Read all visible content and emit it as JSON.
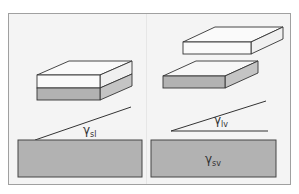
{
  "diagram": {
    "colors": {
      "frame_fill": "#f4f4f4",
      "frame_border": "#9a9a9a",
      "substrate_fill": "#b2b2b2",
      "layer_gray": "#b2b2b2",
      "layer_gray_side": "#c4c4c4",
      "layer_white": "#fafafa",
      "line": "#333333"
    },
    "panels": [
      {
        "id": "left",
        "label_symbol": "γ",
        "label_subscript": "sl",
        "description": "Stacked white-on-gray slab with solid-liquid interface"
      },
      {
        "id": "right",
        "label_symbol": "γ",
        "label_subscript": "lv",
        "substrate_label_symbol": "γ",
        "substrate_label_subscript": "sv",
        "description": "Separated white slab above gray slab"
      }
    ]
  }
}
